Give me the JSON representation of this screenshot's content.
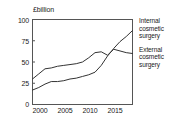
{
  "chart_data": {
    "type": "line",
    "title": "",
    "ylabel": "£billion",
    "xlabel": "",
    "ylim": [
      0,
      100
    ],
    "xlim": [
      2000,
      2016
    ],
    "yticks": [
      "0",
      "25",
      "50",
      "75",
      "100"
    ],
    "ytick_values": [
      0,
      25,
      50,
      75,
      100
    ],
    "xticks": [
      "2000",
      "2005",
      "2010",
      "2015"
    ],
    "xtick_values": [
      2000,
      2005,
      2010,
      2015
    ],
    "grid": false,
    "legend_position": "right",
    "x": [
      2000,
      2001,
      2002,
      2003,
      2004,
      2005,
      2006,
      2007,
      2008,
      2009,
      2010,
      2011,
      2012,
      2013,
      2014,
      2015,
      2016
    ],
    "series": [
      {
        "name": "Internal cosmetic surgery",
        "color": "#333333",
        "values": [
          17,
          20,
          24,
          27,
          27,
          28,
          30,
          31,
          33,
          35,
          38,
          46,
          57,
          66,
          74,
          80,
          87
        ]
      },
      {
        "name": "External cosmetic surgery",
        "color": "#333333",
        "values": [
          30,
          36,
          42,
          43,
          45,
          46,
          47,
          48,
          50,
          55,
          61,
          62,
          58,
          65,
          63,
          61,
          60
        ]
      }
    ]
  },
  "legend": {
    "entries": [
      {
        "line1": "Internal",
        "line2": "cosmetic",
        "line3": "surgery"
      },
      {
        "line1": "External",
        "line2": "cosmetic",
        "line3": "surgery"
      }
    ]
  }
}
